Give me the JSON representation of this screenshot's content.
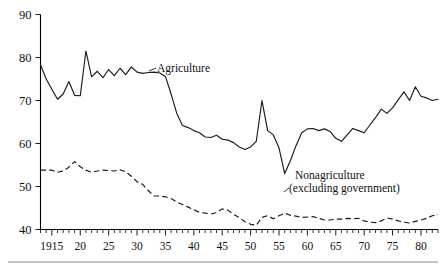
{
  "chart_data": {
    "type": "line",
    "title": "",
    "subtitle": "",
    "xlabel": "",
    "ylabel": "",
    "xlim": [
      1913,
      1983
    ],
    "ylim": [
      40,
      90
    ],
    "grid": false,
    "legend_position": "inline-annotations",
    "y_ticks": [
      40,
      50,
      60,
      70,
      80,
      90
    ],
    "y_tick_labels": [
      "40",
      "50",
      "60",
      "70",
      "80",
      "90"
    ],
    "x_ticks": [
      1915,
      1920,
      1925,
      1930,
      1935,
      1940,
      1945,
      1950,
      1955,
      1960,
      1965,
      1970,
      1975,
      1980
    ],
    "x_tick_labels": [
      "1915",
      "20",
      "25",
      "30",
      "35",
      "40",
      "45",
      "50",
      "55",
      "60",
      "65",
      "70",
      "75",
      "80"
    ],
    "minor_tick_interval": 1,
    "series": [
      {
        "name": "Agriculture",
        "style": "solid",
        "color": "#1a1a1a",
        "x": [
          1913,
          1914,
          1915,
          1916,
          1917,
          1918,
          1919,
          1920,
          1921,
          1922,
          1923,
          1924,
          1925,
          1926,
          1927,
          1928,
          1929,
          1930,
          1931,
          1932,
          1933,
          1934,
          1935,
          1936,
          1937,
          1938,
          1939,
          1940,
          1941,
          1942,
          1943,
          1944,
          1945,
          1946,
          1947,
          1948,
          1949,
          1950,
          1951,
          1952,
          1953,
          1954,
          1955,
          1956,
          1957,
          1958,
          1959,
          1960,
          1961,
          1962,
          1963,
          1964,
          1965,
          1966,
          1967,
          1968,
          1969,
          1970,
          1971,
          1972,
          1973,
          1974,
          1975,
          1976,
          1977,
          1978,
          1979,
          1980,
          1981,
          1982,
          1983
        ],
        "values": [
          78.3,
          75.0,
          72.6,
          70.3,
          71.5,
          74.4,
          71.2,
          71.1,
          81.5,
          75.5,
          76.8,
          75.3,
          77.2,
          75.8,
          77.5,
          76.0,
          77.8,
          76.6,
          76.3,
          76.5,
          76.6,
          76.4,
          75.6,
          71.5,
          67.0,
          64.2,
          63.7,
          63.0,
          62.5,
          61.5,
          61.4,
          61.9,
          61.0,
          60.8,
          60.2,
          59.2,
          58.6,
          59.2,
          60.5,
          70.0,
          63.0,
          62.0,
          59.0,
          53.0,
          56.0,
          59.5,
          62.5,
          63.4,
          63.5,
          63.0,
          63.4,
          62.8,
          61.2,
          60.5,
          62.0,
          63.5,
          63.0,
          62.5,
          64.3,
          66.0,
          68.0,
          67.0,
          68.3,
          70.2,
          72.0,
          70.0,
          73.2,
          71.0,
          70.6,
          70.0,
          70.3
        ]
      },
      {
        "name": "Nonagriculture (excluding government)",
        "style": "dashed",
        "color": "#1a1a1a",
        "x": [
          1913,
          1914,
          1915,
          1916,
          1917,
          1918,
          1919,
          1920,
          1921,
          1922,
          1923,
          1924,
          1925,
          1926,
          1927,
          1928,
          1929,
          1930,
          1931,
          1932,
          1933,
          1934,
          1935,
          1936,
          1937,
          1938,
          1939,
          1940,
          1941,
          1942,
          1943,
          1944,
          1945,
          1946,
          1947,
          1948,
          1949,
          1950,
          1951,
          1952,
          1953,
          1954,
          1955,
          1956,
          1957,
          1958,
          1959,
          1960,
          1961,
          1962,
          1963,
          1964,
          1965,
          1966,
          1967,
          1968,
          1969,
          1970,
          1971,
          1972,
          1973,
          1974,
          1975,
          1976,
          1977,
          1978,
          1979,
          1980,
          1981,
          1982,
          1983
        ],
        "values": [
          53.8,
          53.8,
          53.8,
          53.3,
          53.6,
          54.5,
          55.8,
          54.6,
          53.8,
          53.3,
          53.6,
          53.8,
          53.7,
          53.6,
          53.9,
          53.4,
          52.4,
          51.1,
          50.5,
          49.0,
          47.8,
          47.8,
          47.6,
          47.2,
          46.4,
          45.8,
          45.2,
          44.6,
          44.0,
          43.8,
          43.6,
          43.9,
          44.8,
          44.5,
          43.5,
          42.8,
          41.8,
          41.2,
          41.0,
          42.8,
          43.2,
          42.5,
          43.2,
          43.8,
          43.3,
          43.1,
          42.8,
          42.9,
          43.0,
          42.6,
          42.2,
          42.2,
          42.4,
          42.4,
          42.6,
          42.5,
          42.6,
          42.0,
          41.7,
          41.6,
          42.0,
          42.7,
          42.4,
          42.0,
          41.7,
          41.5,
          41.9,
          42.2,
          42.6,
          43.2,
          43.4
        ]
      }
    ],
    "annotations": [
      {
        "name": "agriculture-label",
        "text": "Agriculture",
        "x_px": 157,
        "y_px": 72,
        "leader": true
      },
      {
        "name": "nonagriculture-label-line1",
        "text": "Nonagriculture",
        "x_px": 295,
        "y_px": 179
      },
      {
        "name": "nonagriculture-label-line2",
        "text": "(excluding government)",
        "x_px": 289,
        "y_px": 192
      }
    ]
  },
  "colors": {
    "background": "#ffffff",
    "ink": "#1a1a1a",
    "rule": "#888888"
  }
}
